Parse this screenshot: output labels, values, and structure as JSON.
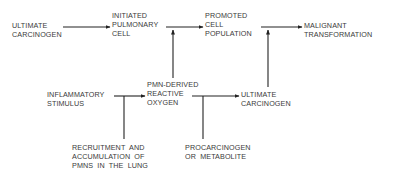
{
  "nodes": {
    "ultimate_carcinogen_top": "ULTIMATE\nCARCINOGEN",
    "initiated_cell": "INITIATED\nPULMONARY\nCELL",
    "promoted_population": "PROMOTED\nCELL\nPOPULATION",
    "malignant_transformation": "MALIGNANT\nTRANSFORMATION",
    "inflammatory_stimulus": "INFLAMMATORY\nSTIMULUS",
    "pmn_reactive_oxygen": "PMN-DERIVED\nREACTIVE\nOXYGEN",
    "ultimate_carcinogen_bottom": "ULTIMATE\nCARCINOGEN",
    "recruitment": "RECRUITMENT  AND\nACCUMULATION  OF\nPMNS  IN  THE  LUNG",
    "procarcinogen": "PROCARCINOGEN\nOR  METABOLITE"
  },
  "colors": {
    "line": "#222222",
    "text": "#3a3a3a",
    "background": "#ffffff"
  }
}
